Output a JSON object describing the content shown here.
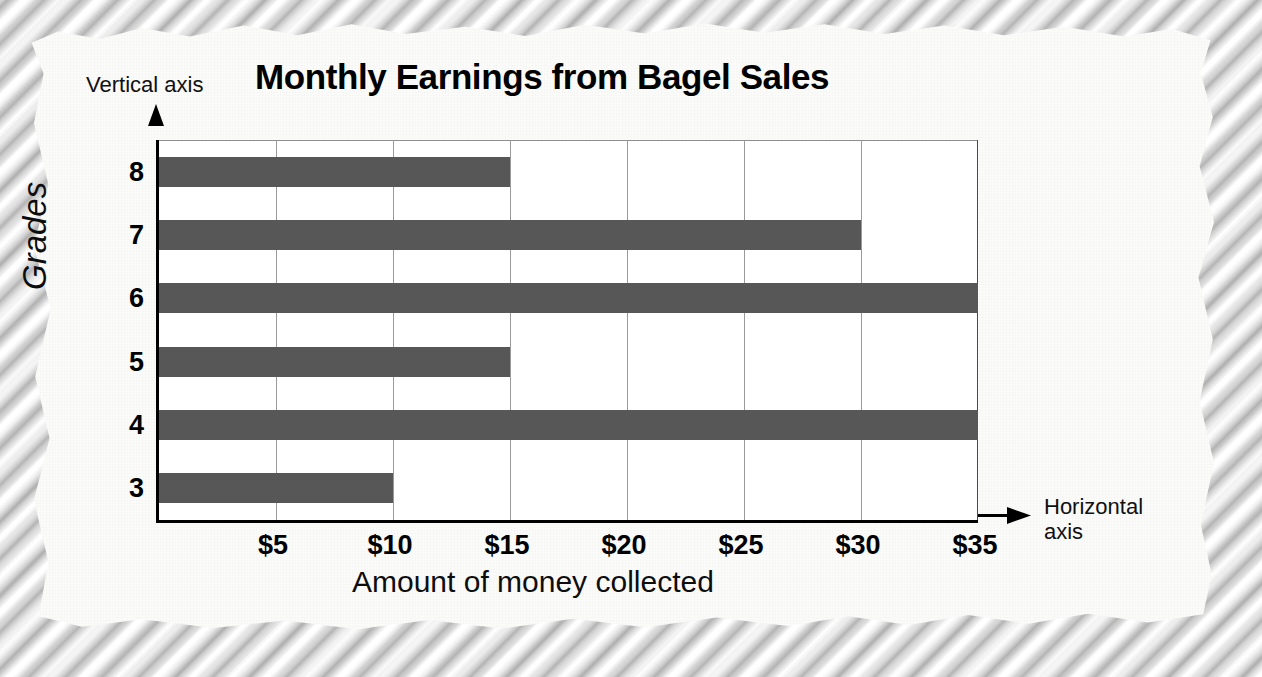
{
  "annotations": {
    "vertical_axis_note": "Vertical axis",
    "horizontal_axis_note_line1": "Horizontal",
    "horizontal_axis_note_line2": "axis"
  },
  "colors": {
    "bar": "#575757",
    "paper": "#fbfbfa",
    "grid": "#9a9a9a",
    "axis": "#000000"
  },
  "chart_data": {
    "type": "bar",
    "orientation": "horizontal",
    "title": "Monthly Earnings from Bagel Sales",
    "xlabel": "Amount of money collected",
    "ylabel": "Grades",
    "categories": [
      "8",
      "7",
      "6",
      "5",
      "4",
      "3"
    ],
    "values": [
      15,
      30,
      35,
      15,
      35,
      10
    ],
    "xticks": [
      5,
      10,
      15,
      20,
      25,
      30,
      35
    ],
    "xtick_labels": [
      "$5",
      "$10",
      "$15",
      "$20",
      "$25",
      "$30",
      "$35"
    ],
    "ytick_labels": [
      "8",
      "7",
      "6",
      "5",
      "4",
      "3"
    ],
    "xlim": [
      0,
      35
    ],
    "grid": true,
    "legend": null,
    "bars": [
      {
        "category": "8",
        "value": 15,
        "label": "$15"
      },
      {
        "category": "7",
        "value": 30,
        "label": "$30"
      },
      {
        "category": "6",
        "value": 35,
        "label": "$35"
      },
      {
        "category": "5",
        "value": 15,
        "label": "$15"
      },
      {
        "category": "4",
        "value": 35,
        "label": "$35"
      },
      {
        "category": "3",
        "value": 10,
        "label": "$10"
      }
    ]
  }
}
